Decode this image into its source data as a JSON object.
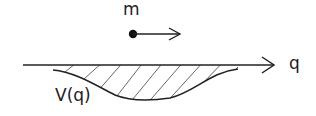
{
  "labels": {
    "mass": "m",
    "axis": "q",
    "potential": "V(q)"
  },
  "colors": {
    "stroke": "#222222",
    "hatch": "#444444",
    "background": "#ffffff"
  }
}
